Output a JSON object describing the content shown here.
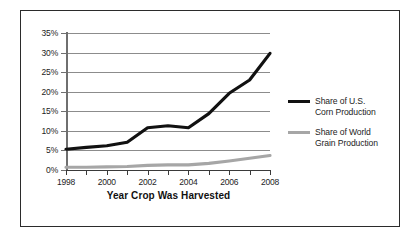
{
  "chart_data": {
    "type": "line",
    "title": "",
    "xlabel": "Year Crop Was Harvested",
    "ylabel": "",
    "xlim": [
      1998,
      2008
    ],
    "ylim": [
      0,
      35
    ],
    "grid": true,
    "legend_position": "right",
    "x": [
      1998,
      1999,
      2000,
      2001,
      2002,
      2003,
      2004,
      2005,
      2006,
      2007,
      2008
    ],
    "x_tick_labels": [
      "1998",
      "2000",
      "2002",
      "2004",
      "2006",
      "2008"
    ],
    "x_tick_values": [
      1998,
      2000,
      2002,
      2004,
      2006,
      2008
    ],
    "y_tick_labels": [
      "0%",
      "5%",
      "10%",
      "15%",
      "20%",
      "25%",
      "30%",
      "35%"
    ],
    "y_tick_values": [
      0,
      5,
      10,
      15,
      20,
      25,
      30,
      35
    ],
    "series": [
      {
        "name": "Share of U.S. Corn Production",
        "legend_label": "Share of U.S.\nCorn Production",
        "color": "#111111",
        "width": 3.2,
        "values": [
          5.3,
          5.8,
          6.2,
          7.1,
          10.8,
          11.3,
          10.8,
          14.4,
          19.6,
          23.0,
          29.8
        ]
      },
      {
        "name": "Share of World Grain Production",
        "legend_label": "Share of World\nGrain Production",
        "color": "#a6a6a6",
        "width": 3.2,
        "values": [
          0.7,
          0.7,
          0.8,
          0.9,
          1.2,
          1.3,
          1.3,
          1.7,
          2.3,
          3.0,
          3.7
        ]
      }
    ]
  },
  "colors": {
    "frame": "#2b2b2b",
    "gridline": "#8c8c8c",
    "axis": "#3a3a3a",
    "text": "#1d1d1d",
    "background": "#ffffff"
  }
}
